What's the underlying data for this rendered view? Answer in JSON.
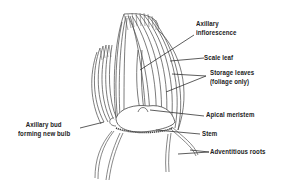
{
  "diagram": {
    "labels": {
      "axillary_inflorescence_1": "Axillary",
      "axillary_inflorescence_2": "inflorescence",
      "scale_leaf": "Scale leaf",
      "storage_leaves_1": "Storage leaves",
      "storage_leaves_2": "(foliage only)",
      "apical_meristem": "Apical meristem",
      "stem": "Stem",
      "adventitious_roots": "Adventitious roots",
      "axillary_bud_1": "Axillary bud",
      "axillary_bud_2": "forming new bulb"
    },
    "colors": {
      "ink": "#333333",
      "background": "#ffffff"
    }
  }
}
